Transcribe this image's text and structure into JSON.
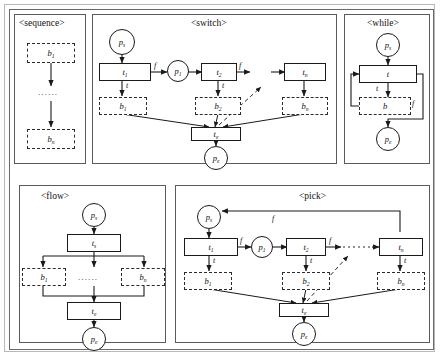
{
  "figure": {
    "title_sequence": "<sequence>",
    "title_switch": "<switch>",
    "title_while": "<while>",
    "title_flow": "<flow>",
    "title_pick": "<pick>",
    "ellipsis_h": "......",
    "ellipsis_v": "......"
  },
  "sequence": {
    "block_first": "b",
    "block_first_sub": "1",
    "block_last": "b",
    "block_last_sub": "n"
  },
  "switch": {
    "place_start": "p",
    "place_start_sub": "s",
    "place_mid": "p",
    "place_mid_sub": "1",
    "place_end": "p",
    "place_end_sub": "e",
    "trans_1": "t",
    "trans_1_sub": "1",
    "trans_2": "t",
    "trans_2_sub": "2",
    "trans_n": "t",
    "trans_n_sub": "n",
    "trans_end": "t",
    "trans_end_sub": "e",
    "block_1": "b",
    "block_1_sub": "1",
    "block_2": "b",
    "block_2_sub": "2",
    "block_n": "b",
    "block_n_sub": "n",
    "edge_true": "t",
    "edge_false": "f"
  },
  "while": {
    "place_start": "p",
    "place_start_sub": "s",
    "place_end": "p",
    "place_end_sub": "e",
    "trans": "t",
    "block": "b",
    "edge_true": "t",
    "edge_false": "f"
  },
  "flow": {
    "place_start": "p",
    "place_start_sub": "s",
    "place_end": "p",
    "place_end_sub": "e",
    "trans_start": "t",
    "trans_start_sub": "s",
    "trans_end": "t",
    "trans_end_sub": "e",
    "block_1": "b",
    "block_1_sub": "1",
    "block_n": "b",
    "block_n_sub": "n"
  },
  "pick": {
    "place_start": "p",
    "place_start_sub": "s",
    "place_mid": "p",
    "place_mid_sub": "1",
    "place_end": "p",
    "place_end_sub": "e",
    "trans_1": "t",
    "trans_1_sub": "1",
    "trans_2": "t",
    "trans_2_sub": "2",
    "trans_n": "t",
    "trans_n_sub": "n",
    "trans_end": "t",
    "trans_end_sub": "e",
    "block_1": "b",
    "block_1_sub": "1",
    "block_2": "b",
    "block_2_sub": "2",
    "block_n": "b",
    "block_n_sub": "n",
    "edge_true": "t",
    "edge_false": "f",
    "edge_feedback": "f"
  },
  "colors": {
    "line": "#1a1a1a",
    "dashed": "#2b2b2b",
    "panel_border": "#5a5a5a",
    "outer_border": "#b9b9b9",
    "background": "#ffffff"
  }
}
